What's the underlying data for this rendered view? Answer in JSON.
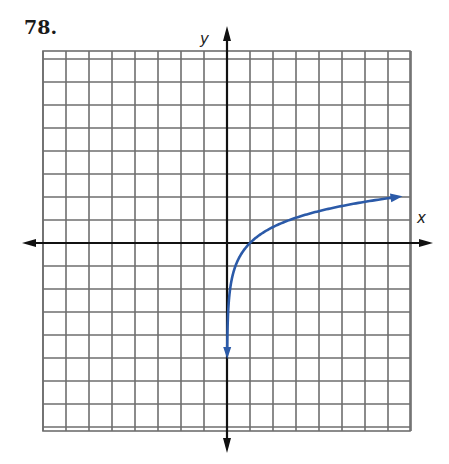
{
  "problem_number": "78.",
  "chart_data": {
    "type": "line",
    "title": "",
    "xlabel": "x",
    "ylabel": "y",
    "xlim": [
      -8,
      8
    ],
    "ylim": [
      -8,
      8
    ],
    "grid": true,
    "grid_step": 1,
    "series": [
      {
        "name": "y = ln x",
        "color": "#2b5aa8",
        "x": [
          0.01,
          0.05,
          0.1,
          0.25,
          0.5,
          1,
          2,
          3,
          4,
          5,
          6,
          7.4
        ],
        "y": [
          -4.6,
          -3.0,
          -2.3,
          -1.39,
          -0.69,
          0,
          0.69,
          1.1,
          1.39,
          1.61,
          1.79,
          2.0
        ],
        "arrows": [
          "start",
          "end"
        ]
      }
    ]
  },
  "layout": {
    "origin_px": [
      227,
      243
    ],
    "unit_px": 23,
    "grid_px": {
      "left": 43,
      "top": 51,
      "right": 410,
      "bottom": 431
    }
  }
}
